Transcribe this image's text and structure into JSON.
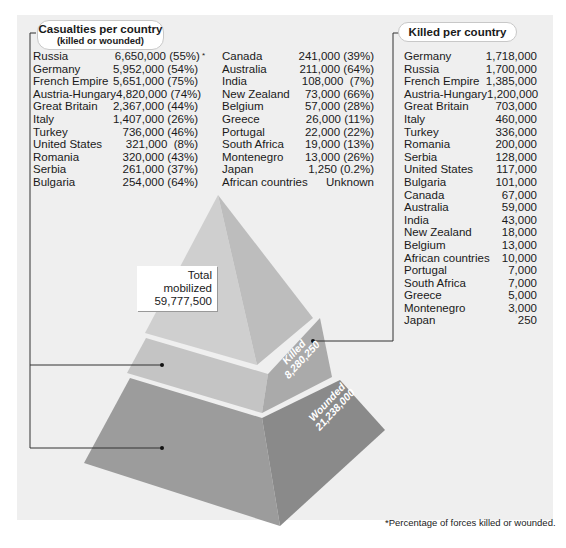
{
  "casualties": {
    "title": "Casualties per country",
    "subtitle": "(killed or wounded)",
    "columns": [
      [
        {
          "country": "Russia",
          "value": "6,650,000 (55%)",
          "footnote_mark": "*"
        },
        {
          "country": "Germany",
          "value": "5,952,000 (54%)"
        },
        {
          "country": "French Empire",
          "value": "5,651,000 (75%)"
        },
        {
          "country": "Austria-Hungary",
          "value": "4,820,000 (74%)"
        },
        {
          "country": "Great Britain",
          "value": "2,367,000 (44%)"
        },
        {
          "country": "Italy",
          "value": "1,407,000 (26%)"
        },
        {
          "country": "Turkey",
          "value": "736,000 (46%)"
        },
        {
          "country": "United States",
          "value": "321,000  (8%)"
        },
        {
          "country": "Romania",
          "value": "320,000 (43%)"
        },
        {
          "country": "Serbia",
          "value": "261,000 (37%)"
        },
        {
          "country": "Bulgaria",
          "value": "254,000 (64%)"
        }
      ],
      [
        {
          "country": "Canada",
          "value": "241,000 (39%)"
        },
        {
          "country": "Australia",
          "value": "211,000 (64%)"
        },
        {
          "country": "India",
          "value": "108,000  (7%)"
        },
        {
          "country": "New Zealand",
          "value": "73,000 (66%)"
        },
        {
          "country": "Belgium",
          "value": "57,000 (28%)"
        },
        {
          "country": "Greece",
          "value": "26,000 (11%)"
        },
        {
          "country": "Portugal",
          "value": "22,000 (22%)"
        },
        {
          "country": "South Africa",
          "value": "19,000 (13%)"
        },
        {
          "country": "Montenegro",
          "value": "13,000 (26%)"
        },
        {
          "country": "Japan",
          "value": "1,250 (0.2%)"
        },
        {
          "country": "African countries",
          "value": "Unknown"
        }
      ]
    ]
  },
  "killed": {
    "title": "Killed per country",
    "rows": [
      {
        "country": "Germany",
        "value": "1,718,000"
      },
      {
        "country": "Russia",
        "value": "1,700,000"
      },
      {
        "country": "French Empire",
        "value": "1,385,000"
      },
      {
        "country": "Austria-Hungary",
        "value": "1,200,000"
      },
      {
        "country": "Great Britain",
        "value": "703,000"
      },
      {
        "country": "Italy",
        "value": "460,000"
      },
      {
        "country": "Turkey",
        "value": "336,000"
      },
      {
        "country": "Romania",
        "value": "200,000"
      },
      {
        "country": "Serbia",
        "value": "128,000"
      },
      {
        "country": "United States",
        "value": "117,000"
      },
      {
        "country": "Bulgaria",
        "value": "101,000"
      },
      {
        "country": "Canada",
        "value": "67,000"
      },
      {
        "country": "Australia",
        "value": "59,000"
      },
      {
        "country": "India",
        "value": "43,000"
      },
      {
        "country": "New Zealand",
        "value": "18,000"
      },
      {
        "country": "Belgium",
        "value": "13,000"
      },
      {
        "country": "African countries",
        "value": "10,000"
      },
      {
        "country": "Portugal",
        "value": "7,000"
      },
      {
        "country": "South Africa",
        "value": "7,000"
      },
      {
        "country": "Greece",
        "value": "5,000"
      },
      {
        "country": "Montenegro",
        "value": "3,000"
      },
      {
        "country": "Japan",
        "value": "250"
      }
    ]
  },
  "pyramid": {
    "total": {
      "label": "Total mobilized",
      "value": "59,777,500"
    },
    "killed": {
      "label": "Killed",
      "value": "8,280,250"
    },
    "wounded": {
      "label": "Wounded",
      "value": "21,238,000"
    },
    "colors": {
      "top_left": "#cfcfcf",
      "top_right": "#bdbdbd",
      "mid_left": "#c4c4c4",
      "mid_right": "#aaaaaa",
      "bot_left": "#9c9c9c",
      "bot_right": "#8a8a8a",
      "panel": "#efefef"
    }
  },
  "footnote": "*Percentage of forces killed or wounded."
}
